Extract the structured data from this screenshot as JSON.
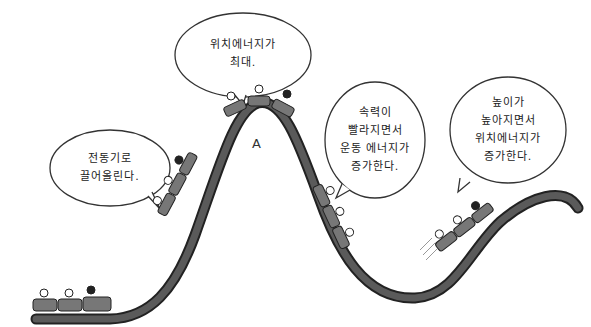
{
  "diagram": {
    "point_label": "A",
    "colors": {
      "track": "#4a4a4a",
      "track_edge": "#222222",
      "car": "#6e6e6e",
      "bubble_stroke": "#333333",
      "background": "#ffffff"
    },
    "bubbles": [
      {
        "id": "lift",
        "lines": [
          "전동기로",
          "끌어올린다."
        ]
      },
      {
        "id": "top",
        "lines": [
          "위치에너지가",
          "최대."
        ]
      },
      {
        "id": "descent",
        "lines": [
          "속력이",
          "빨라지면서",
          "운동 에너지가",
          "증가한다."
        ]
      },
      {
        "id": "climb",
        "lines": [
          "높이가",
          "높아지면서",
          "위치에너지가",
          "증가한다."
        ]
      }
    ],
    "trains": [
      {
        "id": "station",
        "cars": 3
      },
      {
        "id": "lift-hill",
        "cars": 3
      },
      {
        "id": "summit",
        "cars": 3
      },
      {
        "id": "drop",
        "cars": 3
      },
      {
        "id": "second-climb",
        "cars": 3
      }
    ]
  }
}
